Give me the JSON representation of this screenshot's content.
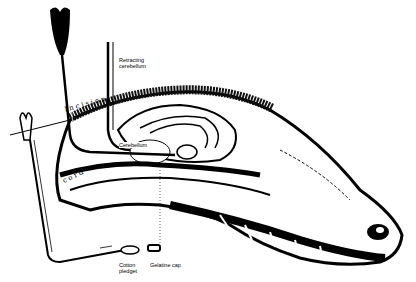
{
  "figure": {
    "labels": {
      "retracting_1": "Retracting",
      "retracting_2": "cerebellum",
      "cerebellum": "Cerebellum",
      "incision": "Incision",
      "cord": "cord",
      "cotton_1": "Cotton",
      "cotton_2": "pledget",
      "gelatine": "Gelatine cap"
    }
  }
}
